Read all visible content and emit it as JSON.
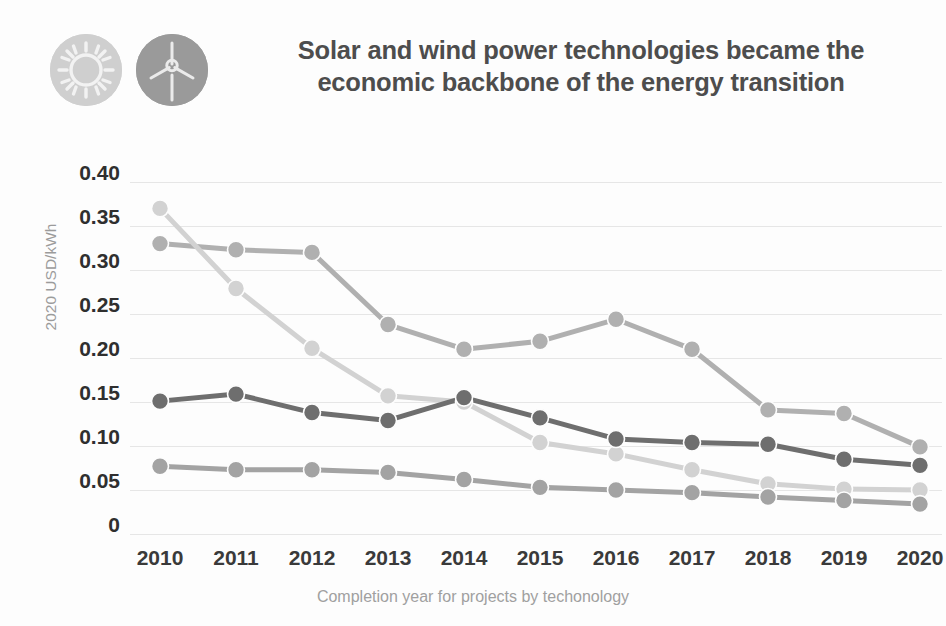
{
  "header": {
    "title": "Solar and wind power technologies became the economic backbone of the energy transition",
    "icons": [
      {
        "name": "sun-icon",
        "color": "#cfcfcf"
      },
      {
        "name": "wind-turbine-icon",
        "color": "#9a9a9a"
      }
    ]
  },
  "chart_data": {
    "type": "line",
    "title": "Solar and wind power technologies became the economic backbone of the energy transition",
    "xlabel": "Completion year for projects by techonology",
    "ylabel": "2020 USD/kWh",
    "categories": [
      "2010",
      "2011",
      "2012",
      "2013",
      "2014",
      "2015",
      "2016",
      "2017",
      "2018",
      "2019",
      "2020"
    ],
    "ylim": [
      0,
      0.4
    ],
    "yticks": [
      0,
      0.05,
      0.1,
      0.15,
      0.2,
      0.25,
      0.3,
      0.35,
      0.4
    ],
    "ytick_labels": [
      "0",
      "0.05",
      "0.10",
      "0.15",
      "0.20",
      "0.25",
      "0.30",
      "0.35",
      "0.40"
    ],
    "grid": true,
    "legend": "none",
    "series": [
      {
        "name": "Concentrating solar power",
        "color": "#b0b0b0",
        "values": [
          0.33,
          0.323,
          0.32,
          0.238,
          0.21,
          0.219,
          0.244,
          0.21,
          0.141,
          0.137,
          0.099
        ]
      },
      {
        "name": "Solar photovoltaic",
        "color": "#d2d2d2",
        "values": [
          0.37,
          0.279,
          0.211,
          0.157,
          0.15,
          0.104,
          0.091,
          0.073,
          0.057,
          0.051,
          0.05
        ]
      },
      {
        "name": "Offshore wind",
        "color": "#6e6e6e",
        "values": [
          0.151,
          0.159,
          0.138,
          0.129,
          0.155,
          0.132,
          0.108,
          0.104,
          0.102,
          0.085,
          0.078
        ]
      },
      {
        "name": "Onshore wind",
        "color": "#a3a3a3",
        "values": [
          0.077,
          0.073,
          0.073,
          0.07,
          0.062,
          0.053,
          0.05,
          0.047,
          0.042,
          0.038,
          0.034
        ]
      }
    ]
  }
}
